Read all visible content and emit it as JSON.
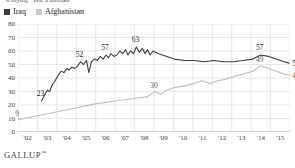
{
  "caption": "% saying \"Yes, a mistake\"",
  "footer": {
    "brand": "GALLUP",
    "trademark": "™"
  },
  "legend": {
    "position": "top-left",
    "items": [
      {
        "label": "Iraq",
        "color": "#3c3c3c",
        "swatch": "legend-swatch-iraq"
      },
      {
        "label": "Afghanistan",
        "color": "#c8c8c8",
        "swatch": "legend-swatch-afghanistan"
      }
    ]
  },
  "chart_data": {
    "type": "line",
    "title": "% saying \"Yes, a mistake\"",
    "xlabel": "",
    "ylabel": "",
    "ylim": [
      0,
      80
    ],
    "yticks": [
      0,
      10,
      20,
      30,
      40,
      50,
      60,
      70,
      80
    ],
    "xticks": [
      "'02",
      "'03",
      "'04",
      "'05",
      "'06",
      "'07",
      "'08",
      "'09",
      "'10",
      "'11",
      "'12",
      "'13",
      "'14",
      "'15"
    ],
    "xlim": [
      2002,
      2015.9
    ],
    "grid": true,
    "legend_position": "top-left",
    "series": [
      {
        "name": "Iraq",
        "color": "#3c3c3c",
        "x": [
          2003.2,
          2003.35,
          2003.5,
          2003.62,
          2003.75,
          2003.9,
          2004.05,
          2004.2,
          2004.35,
          2004.5,
          2004.62,
          2004.75,
          2004.9,
          2005.05,
          2005.2,
          2005.35,
          2005.5,
          2005.62,
          2005.75,
          2005.9,
          2006.05,
          2006.2,
          2006.35,
          2006.5,
          2006.62,
          2006.75,
          2006.9,
          2007.05,
          2007.2,
          2007.35,
          2007.5,
          2007.62,
          2007.75,
          2007.9,
          2008.05,
          2008.2,
          2008.35,
          2008.5,
          2008.62,
          2008.75,
          2008.9,
          2009.2,
          2009.6,
          2010.0,
          2010.5,
          2011.0,
          2011.5,
          2012.0,
          2012.5,
          2013.0,
          2013.5,
          2014.0,
          2014.4,
          2014.8,
          2015.2,
          2015.6,
          2015.85
        ],
        "values": [
          23,
          27,
          31,
          30,
          35,
          38,
          42,
          45,
          44,
          47,
          46,
          48,
          47,
          49,
          52,
          50,
          53,
          44,
          52,
          54,
          53,
          56,
          54,
          57,
          55,
          58,
          56,
          57,
          60,
          58,
          61,
          57,
          60,
          58,
          63,
          59,
          62,
          58,
          61,
          57,
          60,
          58,
          56,
          54,
          53,
          53,
          52,
          53,
          52,
          52,
          53,
          54,
          57,
          56,
          54,
          52,
          51
        ],
        "labeled_points": [
          {
            "x": 2003.2,
            "value": 23
          },
          {
            "x": 2005.2,
            "value": 52
          },
          {
            "x": 2006.5,
            "value": 57
          },
          {
            "x": 2008.05,
            "value": 63
          },
          {
            "x": 2014.4,
            "value": 57
          },
          {
            "x": 2015.85,
            "value": 51
          }
        ]
      },
      {
        "name": "Afghanistan",
        "color": "#bdbdbd",
        "x": [
          2002.0,
          2003.0,
          2004.0,
          2005.0,
          2006.0,
          2007.0,
          2008.0,
          2008.6,
          2009.0,
          2009.3,
          2009.6,
          2010.0,
          2010.5,
          2011.0,
          2011.4,
          2011.8,
          2012.2,
          2012.6,
          2013.0,
          2013.5,
          2014.0,
          2014.4,
          2014.8,
          2015.2,
          2015.6,
          2015.85
        ],
        "values": [
          9,
          12,
          15,
          18,
          21,
          23,
          25,
          26,
          30,
          28,
          31,
          33,
          34,
          36,
          38,
          36,
          38,
          39,
          41,
          43,
          45,
          49,
          47,
          45,
          43,
          42
        ],
        "labeled_points": [
          {
            "x": 2002.0,
            "value": 9
          },
          {
            "x": 2009.0,
            "value": 30
          },
          {
            "x": 2014.4,
            "value": 49
          },
          {
            "x": 2015.85,
            "value": 42
          }
        ]
      }
    ]
  }
}
